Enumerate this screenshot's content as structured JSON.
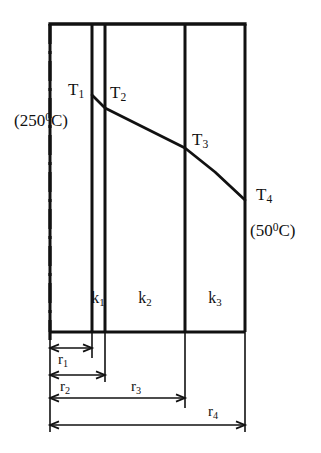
{
  "figure": {
    "type": "engineering-cross-section-diagram",
    "background_color": "#ffffff",
    "line_color": "#111111"
  },
  "axis": {
    "centerline_name": "axis-of-symmetry",
    "style": "dash-dot",
    "x": 50,
    "y_top": 24,
    "y_bottom": 346
  },
  "wall": {
    "x_left": 50,
    "x_right": 245,
    "y_top": 24,
    "y_bottom": 332,
    "interfaces_x": [
      92,
      105,
      185
    ]
  },
  "layers": [
    {
      "id": "k1",
      "label": "k",
      "subscript": "1",
      "x_center": 98,
      "y": 290
    },
    {
      "id": "k2",
      "label": "k",
      "subscript": "2",
      "x_center": 145,
      "y": 290
    },
    {
      "id": "k3",
      "label": "k",
      "subscript": "3",
      "x_center": 215,
      "y": 290
    }
  ],
  "temperature_nodes": [
    {
      "id": "T1",
      "label": "T",
      "subscript": "1",
      "x": 68,
      "y": 81
    },
    {
      "id": "T2",
      "label": "T",
      "subscript": "2",
      "x": 110,
      "y": 84
    },
    {
      "id": "T3",
      "label": "T",
      "subscript": "3",
      "x": 192,
      "y": 131
    },
    {
      "id": "T4",
      "label": "T",
      "subscript": "4",
      "x": 256,
      "y": 186
    }
  ],
  "temperature_values": {
    "inner": "(250",
    "inner_deg": "0",
    "inner_unit": "C)",
    "inner_x": 14,
    "inner_y": 112,
    "outer": "(50",
    "outer_deg": "0",
    "outer_unit": "C)",
    "outer_x": 250,
    "outer_y": 222
  },
  "temperature_curve": {
    "name": "temperature-profile",
    "points": [
      {
        "x": 92,
        "y": 95
      },
      {
        "x": 105,
        "y": 108
      },
      {
        "x": 145,
        "y": 128
      },
      {
        "x": 185,
        "y": 148
      },
      {
        "x": 215,
        "y": 172
      },
      {
        "x": 245,
        "y": 200
      }
    ]
  },
  "dimensions": [
    {
      "id": "r1",
      "label": "r",
      "subscript": "1",
      "x_start": 50,
      "x_end": 92,
      "y_line": 348,
      "label_x": 58,
      "label_y": 352
    },
    {
      "id": "r2",
      "label": "r",
      "subscript": "2",
      "x_start": 50,
      "x_end": 105,
      "y_line": 375,
      "label_x": 60,
      "label_y": 379
    },
    {
      "id": "r3",
      "label": "r",
      "subscript": "3",
      "x_start": 50,
      "x_end": 185,
      "y_line": 398,
      "label_x": 131,
      "label_y": 379
    },
    {
      "id": "r4",
      "label": "r",
      "subscript": "4",
      "x_start": 50,
      "x_end": 245,
      "y_line": 425,
      "label_x": 208,
      "label_y": 404
    }
  ],
  "extension_lines": [
    {
      "x": 50,
      "y_top": 332,
      "y_bottom": 432
    },
    {
      "x": 92,
      "y_top": 332,
      "y_bottom": 358
    },
    {
      "x": 105,
      "y_top": 332,
      "y_bottom": 382
    },
    {
      "x": 185,
      "y_top": 332,
      "y_bottom": 408
    },
    {
      "x": 245,
      "y_top": 332,
      "y_bottom": 432
    }
  ]
}
